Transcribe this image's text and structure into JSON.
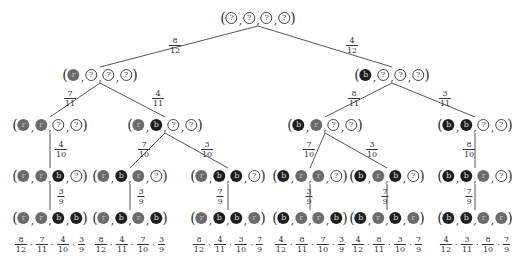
{
  "diagram": {
    "type": "probability-tree",
    "legend_symbols": {
      "q": "?",
      "r": "r",
      "b": "b"
    },
    "colors": {
      "red_ball": "#6b6b6b",
      "blue_ball": "#1e1e1e",
      "unknown_ball_border": "#444444",
      "edge": "#555555"
    },
    "nodes": [
      {
        "id": "root",
        "x": 258,
        "y": 18,
        "balls": [
          "q",
          "q",
          "q",
          "q"
        ]
      },
      {
        "id": "n_r",
        "x": 100,
        "y": 75,
        "balls": [
          "r",
          "q",
          "q",
          "q"
        ]
      },
      {
        "id": "n_b",
        "x": 392,
        "y": 75,
        "balls": [
          "b",
          "q",
          "q",
          "q"
        ]
      },
      {
        "id": "n_rr",
        "x": 50,
        "y": 125,
        "balls": [
          "r",
          "r",
          "q",
          "q"
        ]
      },
      {
        "id": "n_rb",
        "x": 165,
        "y": 125,
        "balls": [
          "r",
          "b",
          "q",
          "q"
        ]
      },
      {
        "id": "n_br",
        "x": 325,
        "y": 125,
        "balls": [
          "b",
          "r",
          "q",
          "q"
        ]
      },
      {
        "id": "n_bb",
        "x": 475,
        "y": 125,
        "balls": [
          "b",
          "b",
          "q",
          "q"
        ]
      },
      {
        "id": "n_rrb",
        "x": 50,
        "y": 176,
        "balls": [
          "r",
          "r",
          "b",
          "q"
        ]
      },
      {
        "id": "n_rbr",
        "x": 130,
        "y": 176,
        "balls": [
          "r",
          "b",
          "r",
          "q"
        ]
      },
      {
        "id": "n_rbb",
        "x": 228,
        "y": 176,
        "balls": [
          "r",
          "b",
          "b",
          "q"
        ]
      },
      {
        "id": "n_brr",
        "x": 310,
        "y": 176,
        "balls": [
          "b",
          "r",
          "r",
          "q"
        ]
      },
      {
        "id": "n_brb",
        "x": 387,
        "y": 176,
        "balls": [
          "b",
          "r",
          "b",
          "q"
        ]
      },
      {
        "id": "n_bbr",
        "x": 475,
        "y": 176,
        "balls": [
          "b",
          "b",
          "r",
          "q"
        ]
      },
      {
        "id": "n_rrbb",
        "x": 50,
        "y": 218,
        "balls": [
          "r",
          "r",
          "b",
          "b"
        ]
      },
      {
        "id": "n_rbrb",
        "x": 130,
        "y": 218,
        "balls": [
          "r",
          "b",
          "r",
          "b"
        ]
      },
      {
        "id": "n_rbbr",
        "x": 228,
        "y": 218,
        "balls": [
          "r",
          "b",
          "b",
          "r"
        ]
      },
      {
        "id": "n_brrb",
        "x": 310,
        "y": 218,
        "balls": [
          "b",
          "r",
          "r",
          "b"
        ]
      },
      {
        "id": "n_brbr",
        "x": 387,
        "y": 218,
        "balls": [
          "b",
          "r",
          "b",
          "r"
        ]
      },
      {
        "id": "n_bbrr",
        "x": 475,
        "y": 218,
        "balls": [
          "b",
          "b",
          "r",
          "r"
        ]
      }
    ],
    "edges": [
      {
        "from": "root",
        "to": "n_r",
        "num": "8",
        "den": "12",
        "lx": 175,
        "ly": 46
      },
      {
        "from": "root",
        "to": "n_b",
        "num": "4",
        "den": "12",
        "lx": 352,
        "ly": 46
      },
      {
        "from": "n_r",
        "to": "n_rr",
        "num": "7",
        "den": "11",
        "lx": 70,
        "ly": 99
      },
      {
        "from": "n_r",
        "to": "n_rb",
        "num": "4",
        "den": "11",
        "lx": 158,
        "ly": 99
      },
      {
        "from": "n_b",
        "to": "n_br",
        "num": "8",
        "den": "11",
        "lx": 354,
        "ly": 99
      },
      {
        "from": "n_b",
        "to": "n_bb",
        "num": "3",
        "den": "11",
        "lx": 445,
        "ly": 99
      },
      {
        "from": "n_rr",
        "to": "n_rrb",
        "num": "4",
        "den": "10",
        "lx": 61,
        "ly": 150
      },
      {
        "from": "n_rb",
        "to": "n_rbr",
        "num": "7",
        "den": "10",
        "lx": 144,
        "ly": 150
      },
      {
        "from": "n_rb",
        "to": "n_rbb",
        "num": "3",
        "den": "10",
        "lx": 207,
        "ly": 150
      },
      {
        "from": "n_br",
        "to": "n_brr",
        "num": "7",
        "den": "10",
        "lx": 309,
        "ly": 150
      },
      {
        "from": "n_br",
        "to": "n_brb",
        "num": "3",
        "den": "10",
        "lx": 372,
        "ly": 150
      },
      {
        "from": "n_bb",
        "to": "n_bbr",
        "num": "8",
        "den": "10",
        "lx": 469,
        "ly": 150
      },
      {
        "from": "n_rrb",
        "to": "n_rrbb",
        "num": "3",
        "den": "9",
        "lx": 61,
        "ly": 197
      },
      {
        "from": "n_rbr",
        "to": "n_rbrb",
        "num": "3",
        "den": "9",
        "lx": 141,
        "ly": 197
      },
      {
        "from": "n_rbb",
        "to": "n_rbbr",
        "num": "7",
        "den": "9",
        "lx": 220,
        "ly": 197
      },
      {
        "from": "n_brr",
        "to": "n_brrb",
        "num": "3",
        "den": "9",
        "lx": 309,
        "ly": 197
      },
      {
        "from": "n_brb",
        "to": "n_brbr",
        "num": "7",
        "den": "9",
        "lx": 385,
        "ly": 197
      },
      {
        "from": "n_bbr",
        "to": "n_bbrr",
        "num": "7",
        "den": "9",
        "lx": 469,
        "ly": 197
      }
    ],
    "products": [
      {
        "x": 50,
        "y": 245,
        "factors": [
          [
            "8",
            "12"
          ],
          [
            "7",
            "11"
          ],
          [
            "4",
            "10"
          ],
          [
            "3",
            "9"
          ]
        ]
      },
      {
        "x": 130,
        "y": 245,
        "factors": [
          [
            "8",
            "12"
          ],
          [
            "4",
            "11"
          ],
          [
            "7",
            "10"
          ],
          [
            "3",
            "9"
          ]
        ]
      },
      {
        "x": 228,
        "y": 245,
        "factors": [
          [
            "8",
            "12"
          ],
          [
            "4",
            "11"
          ],
          [
            "3",
            "10"
          ],
          [
            "7",
            "9"
          ]
        ]
      },
      {
        "x": 310,
        "y": 245,
        "factors": [
          [
            "4",
            "12"
          ],
          [
            "8",
            "11"
          ],
          [
            "7",
            "10"
          ],
          [
            "3",
            "9"
          ]
        ]
      },
      {
        "x": 387,
        "y": 245,
        "factors": [
          [
            "4",
            "12"
          ],
          [
            "8",
            "11"
          ],
          [
            "3",
            "10"
          ],
          [
            "7",
            "9"
          ]
        ]
      },
      {
        "x": 475,
        "y": 245,
        "factors": [
          [
            "4",
            "12"
          ],
          [
            "3",
            "11"
          ],
          [
            "8",
            "10"
          ],
          [
            "7",
            "9"
          ]
        ]
      }
    ]
  }
}
